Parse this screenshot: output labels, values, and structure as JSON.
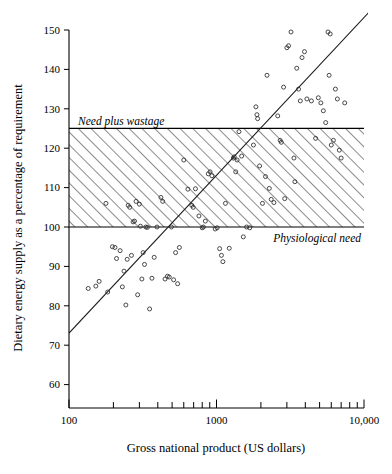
{
  "figure": {
    "background_color": "#ffffff",
    "ink_color": "#000000"
  },
  "chart_data": {
    "type": "scatter",
    "title": "",
    "subtitle": "",
    "xlabel": "Gross national product (US dollars)",
    "ylabel": "Dietary energy supply as a percentage of requirement",
    "xscale": "log",
    "yscale": "linear",
    "xlim": [
      100,
      10000
    ],
    "ylim": [
      55,
      152
    ],
    "grid": false,
    "legend": null,
    "xticks_major": [
      100,
      1000,
      10000
    ],
    "xtick_labels": [
      "100",
      "1000",
      "10,000"
    ],
    "xticks_minor": [
      200,
      300,
      400,
      500,
      600,
      700,
      800,
      900,
      2000,
      3000,
      4000,
      5000,
      6000,
      7000,
      8000,
      9000
    ],
    "yticks": [
      60,
      70,
      80,
      90,
      100,
      110,
      120,
      130,
      140,
      150
    ],
    "ytick_labels": [
      "60",
      "70",
      "80",
      "90",
      "100",
      "110",
      "120",
      "130",
      "140",
      "150"
    ],
    "annotations": [
      {
        "text": "Need plus wastage",
        "value": 125,
        "style": "italic",
        "position": "above-line-left"
      },
      {
        "text": "Physiological need",
        "value": 100,
        "style": "italic",
        "position": "below-line-right"
      }
    ],
    "shaded_band": {
      "label": "hatched band between physiological need and need plus wastage",
      "y_low": 100,
      "y_high": 125,
      "fill": "diagonal-hatch",
      "hatch_color": "#7a7a7a"
    },
    "trend_line": {
      "label": "regression line",
      "points": [
        [
          100,
          73.0
        ],
        [
          12000,
          153.5
        ]
      ]
    },
    "series": [
      {
        "name": "Countries",
        "marker": "open-circle",
        "points": [
          [
            135,
            84.4
          ],
          [
            152,
            85.0
          ],
          [
            160,
            86.2
          ],
          [
            178,
            106.0
          ],
          [
            183,
            83.5
          ],
          [
            197,
            95.0
          ],
          [
            205,
            94.8
          ],
          [
            210,
            92.0
          ],
          [
            222,
            94.0
          ],
          [
            230,
            84.8
          ],
          [
            236,
            88.8
          ],
          [
            243,
            80.2
          ],
          [
            248,
            91.8
          ],
          [
            252,
            105.5
          ],
          [
            258,
            105.0
          ],
          [
            265,
            92.8
          ],
          [
            272,
            101.3
          ],
          [
            278,
            101.5
          ],
          [
            285,
            106.5
          ],
          [
            292,
            82.8
          ],
          [
            300,
            105.8
          ],
          [
            305,
            100.2
          ],
          [
            312,
            86.8
          ],
          [
            318,
            93.5
          ],
          [
            325,
            90.5
          ],
          [
            332,
            100.0
          ],
          [
            340,
            99.9
          ],
          [
            352,
            79.2
          ],
          [
            365,
            87.0
          ],
          [
            378,
            92.3
          ],
          [
            395,
            100.0
          ],
          [
            420,
            107.5
          ],
          [
            432,
            106.5
          ],
          [
            448,
            86.8
          ],
          [
            465,
            87.5
          ],
          [
            478,
            87.3
          ],
          [
            495,
            100.0
          ],
          [
            512,
            86.6
          ],
          [
            528,
            93.5
          ],
          [
            545,
            85.6
          ],
          [
            560,
            94.8
          ],
          [
            600,
            117.0
          ],
          [
            640,
            109.6
          ],
          [
            680,
            105.5
          ],
          [
            695,
            105.0
          ],
          [
            720,
            109.7
          ],
          [
            760,
            102.8
          ],
          [
            800,
            99.8
          ],
          [
            815,
            100.0
          ],
          [
            840,
            101.5
          ],
          [
            880,
            113.5
          ],
          [
            905,
            114.0
          ],
          [
            930,
            113.0
          ],
          [
            980,
            99.5
          ],
          [
            1010,
            99.8
          ],
          [
            1050,
            94.5
          ],
          [
            1080,
            92.8
          ],
          [
            1105,
            91.2
          ],
          [
            1150,
            106.0
          ],
          [
            1220,
            94.6
          ],
          [
            1300,
            117.5
          ],
          [
            1320,
            117.8
          ],
          [
            1350,
            114.0
          ],
          [
            1380,
            117.0
          ],
          [
            1420,
            124.2
          ],
          [
            1480,
            118.0
          ],
          [
            1520,
            97.5
          ],
          [
            1600,
            100.0
          ],
          [
            1680,
            99.8
          ],
          [
            1780,
            120.8
          ],
          [
            1850,
            130.5
          ],
          [
            1880,
            128.5
          ],
          [
            1900,
            127.5
          ],
          [
            1960,
            115.5
          ],
          [
            2050,
            106.0
          ],
          [
            2150,
            112.8
          ],
          [
            2200,
            138.5
          ],
          [
            2280,
            109.8
          ],
          [
            2350,
            107.0
          ],
          [
            2450,
            106.2
          ],
          [
            2600,
            128.2
          ],
          [
            2700,
            122.0
          ],
          [
            2750,
            121.5
          ],
          [
            2850,
            135.5
          ],
          [
            2900,
            107.2
          ],
          [
            3000,
            145.5
          ],
          [
            3080,
            146.0
          ],
          [
            3200,
            149.5
          ],
          [
            3350,
            117.5
          ],
          [
            3400,
            111.5
          ],
          [
            3500,
            140.3
          ],
          [
            3600,
            135.0
          ],
          [
            3700,
            132.0
          ],
          [
            3800,
            143.0
          ],
          [
            3950,
            144.5
          ],
          [
            4100,
            132.5
          ],
          [
            4400,
            132.0
          ],
          [
            4700,
            122.5
          ],
          [
            4900,
            132.8
          ],
          [
            5100,
            131.5
          ],
          [
            5300,
            129.5
          ],
          [
            5500,
            126.5
          ],
          [
            5700,
            149.5
          ],
          [
            5800,
            138.5
          ],
          [
            5900,
            149.0
          ],
          [
            6000,
            120.8
          ],
          [
            6200,
            122.0
          ],
          [
            6400,
            135.0
          ],
          [
            6600,
            132.5
          ],
          [
            6800,
            119.5
          ],
          [
            7000,
            117.5
          ],
          [
            7400,
            131.5
          ]
        ]
      }
    ]
  }
}
